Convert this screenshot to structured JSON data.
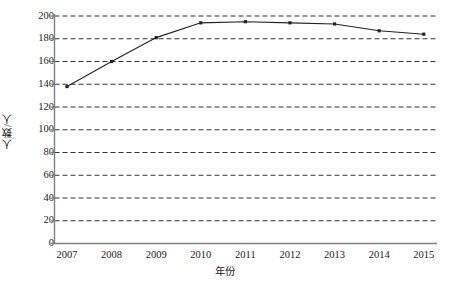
{
  "chart_data": {
    "type": "line",
    "title": "",
    "subtitle": "",
    "xlabel": "年份",
    "ylabel": "人数/人",
    "categories": [
      "2007",
      "2008",
      "2009",
      "2010",
      "2011",
      "2012",
      "2013",
      "2014",
      "2015"
    ],
    "values": [
      138,
      160,
      181,
      194,
      195,
      194,
      193,
      187,
      184
    ],
    "series": [
      {
        "name": "人数",
        "values": [
          138,
          160,
          181,
          194,
          195,
          194,
          193,
          187,
          184
        ]
      }
    ],
    "ylim": [
      0,
      200
    ],
    "ytick_labels": [
      "0",
      "20",
      "40",
      "60",
      "80",
      "100",
      "120",
      "140",
      "160",
      "180",
      "200"
    ],
    "ytick_values": [
      0,
      20,
      40,
      60,
      80,
      100,
      120,
      140,
      160,
      180,
      200
    ],
    "grid": "horizontal-dashed",
    "legend": "none",
    "marker": "square",
    "line_color": "#222222",
    "grid_color": "#333333",
    "axis_color": "#808080",
    "background_color": "#ffffff"
  }
}
